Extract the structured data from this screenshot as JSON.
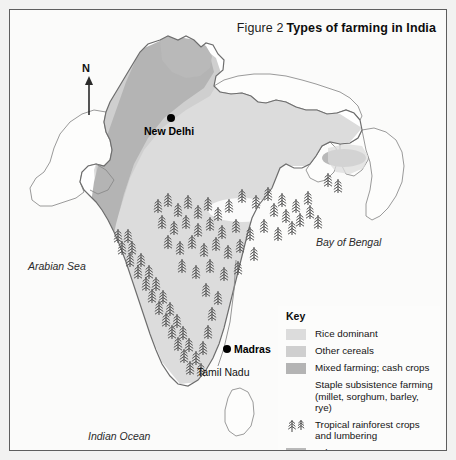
{
  "figure": {
    "number": "Figure 2",
    "title": "Types of farming in India"
  },
  "map": {
    "north_arrow": {
      "label": "N",
      "icon": "north-arrow-icon"
    },
    "cities": [
      {
        "name": "New Delhi",
        "x": 161,
        "y": 108,
        "label_x": 170,
        "label_y": 112
      },
      {
        "name": "Madras",
        "x": 218,
        "y": 339,
        "label_x": 227,
        "label_y": 333
      }
    ],
    "regions": [
      {
        "name": "Tamil Nadu",
        "x": 196,
        "y": 361
      }
    ],
    "water_bodies": [
      {
        "name": "Arabian Sea",
        "x": 18,
        "y": 256
      },
      {
        "name": "Bay of Bengal",
        "x": 308,
        "y": 230
      },
      {
        "name": "Indian Ocean",
        "x": 80,
        "y": 425
      }
    ]
  },
  "legend": {
    "title": "Key",
    "items": [
      {
        "label": "Rice dominant",
        "sub": "",
        "swatch": "#dcdcdc",
        "symbol": "swatch"
      },
      {
        "label": "Other cereals",
        "sub": "",
        "swatch": "#cfcfcf",
        "symbol": "swatch"
      },
      {
        "label": "Mixed farming; cash crops",
        "sub": "",
        "swatch": "#b4b4b4",
        "symbol": "swatch"
      },
      {
        "label": "Staple subsistence farming",
        "sub": "(millet, sorghum, barley, rye)",
        "swatch": "transparent",
        "symbol": "blank"
      },
      {
        "label": "Tropical rainforest crops",
        "sub": "and lumbering",
        "swatch": "transparent",
        "symbol": "trees"
      },
      {
        "label": "Other",
        "sub": "",
        "swatch": "#b9b9b9",
        "symbol": "swatch"
      }
    ]
  },
  "colors": {
    "page_background": "#f2f2f1",
    "map_background": "#fbfbfa",
    "frame_border": "#5e5e5e",
    "rice_dominant": "#dcdcdc",
    "other_cereals": "#cfcfcf",
    "mixed_farming": "#b4b4b4",
    "staple_subsistence": "#ffffff",
    "other": "#b9b9b9",
    "coastline": "#6d6d6d",
    "tree_symbol": "#555555",
    "text": "#111111"
  }
}
